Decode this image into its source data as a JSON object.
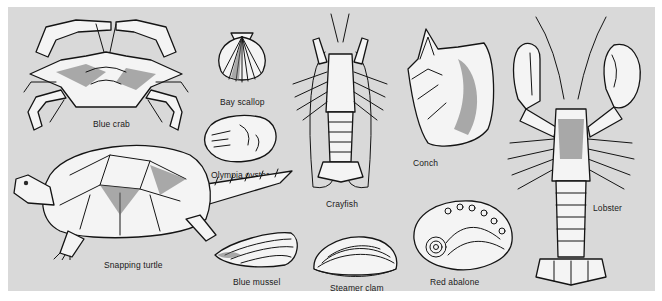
{
  "illustration": {
    "background_color": "#d9d9d9",
    "page_color": "#ffffff",
    "ink_color": "#141414",
    "specimens": [
      {
        "id": "blue-crab",
        "label": "Blue crab"
      },
      {
        "id": "bay-scallop",
        "label": "Bay scallop"
      },
      {
        "id": "olympia-oyster",
        "label": "Olympia oyster"
      },
      {
        "id": "crayfish",
        "label": "Crayfish"
      },
      {
        "id": "conch",
        "label": "Conch"
      },
      {
        "id": "lobster",
        "label": "Lobster"
      },
      {
        "id": "snapping-turtle",
        "label": "Snapping turtle"
      },
      {
        "id": "blue-mussel",
        "label": "Blue mussel"
      },
      {
        "id": "steamer-clam",
        "label": "Steamer clam"
      },
      {
        "id": "red-abalone",
        "label": "Red abalone"
      }
    ]
  }
}
